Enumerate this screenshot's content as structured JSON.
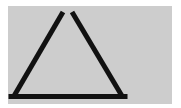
{
  "figure": {
    "background_color": "#cdcdcd",
    "stroke_color": "#111111",
    "shape": "open-apex-triangle",
    "left_stroke": {
      "x1": 63,
      "y1": 12,
      "x2": 14,
      "y2": 97
    },
    "right_stroke": {
      "x1": 72,
      "y1": 12,
      "x2": 123,
      "y2": 97
    },
    "base": {
      "x1": 12,
      "y1": 97,
      "x2": 125,
      "y2": 97
    }
  }
}
